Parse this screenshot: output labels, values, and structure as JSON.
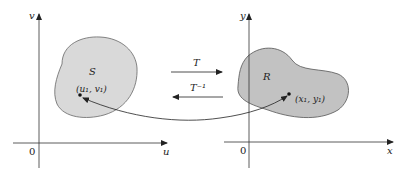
{
  "diagram": {
    "left_plane": {
      "vertical_axis_label": "v",
      "horizontal_axis_label": "u",
      "origin_label": "0",
      "region_label": "S",
      "point_label": "(u₁, v₁)",
      "region_fill": "#d9d9d9"
    },
    "right_plane": {
      "vertical_axis_label": "y",
      "horizontal_axis_label": "x",
      "origin_label": "0",
      "region_label": "R",
      "point_label": "(x₁, y₁)",
      "region_fill": "#c2c2c2"
    },
    "forward_map_label": "T",
    "inverse_map_label": "T⁻¹",
    "colors": {
      "axis": "#333333",
      "outline": "#555555",
      "arrow": "#222222"
    }
  }
}
